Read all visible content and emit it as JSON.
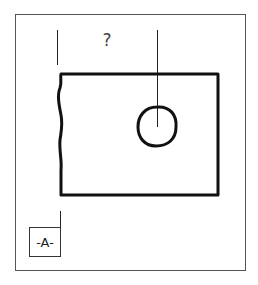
{
  "drawing": {
    "title": "Technical drawing: plate with hole and datum",
    "stroke_color": "#111111",
    "frame_color": "#555555",
    "background": "#ffffff"
  },
  "annotations": {
    "question_mark": "?",
    "datum_label": "-A-"
  },
  "geometry": {
    "frame": {
      "x": 15,
      "y": 14,
      "width": 231,
      "height": 256
    },
    "plate": {
      "left": 60,
      "top": 74,
      "right": 218,
      "bottom": 195
    },
    "hole": {
      "cx": 157,
      "cy": 127,
      "r": 19
    },
    "left_extension_line": {
      "x": 57,
      "y1": 30,
      "y2": 65
    },
    "center_line": {
      "x": 157,
      "y1": 30,
      "y2": 127
    },
    "datum_box": {
      "x": 29,
      "y": 227,
      "width": 31,
      "height": 29
    },
    "datum_leader": {
      "x": 60,
      "y1": 211,
      "y2": 227
    }
  }
}
